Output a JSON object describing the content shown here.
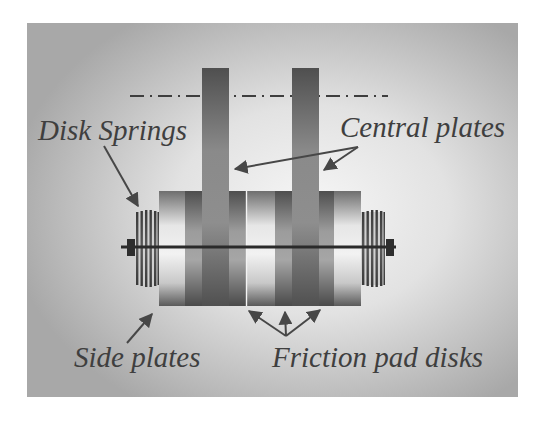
{
  "diagram": {
    "labels": {
      "disk_springs": "Disk Springs",
      "central_plates": "Central plates",
      "side_plates": "Side plates",
      "friction_pad_disks": "Friction pad disks"
    },
    "colors": {
      "panel_edge": "#a9a9a9",
      "panel_center": "#f4f4f4",
      "plate_dark": "#5c5c5c",
      "plate_light": "#9a9a9a",
      "shaft": "#2a2a2a",
      "text": "#3f3f3f",
      "arrow": "#474747"
    }
  }
}
